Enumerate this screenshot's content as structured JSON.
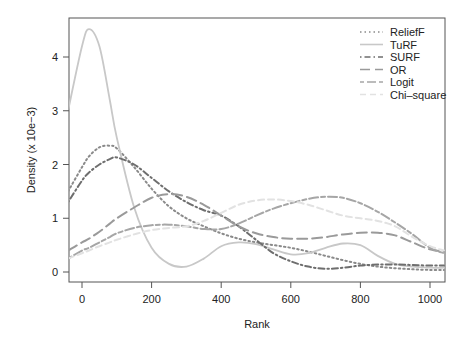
{
  "chart_data": {
    "type": "line",
    "title": "",
    "xlabel": "Rank",
    "ylabel": "Density (x 10e−3)",
    "xlim": [
      -40,
      1040
    ],
    "ylim": [
      -0.05,
      4.7
    ],
    "xticks": [
      "0",
      "200",
      "400",
      "600",
      "800",
      "1000"
    ],
    "xtick_values": [
      0,
      200,
      400,
      600,
      800,
      1000
    ],
    "yticks": [
      "0",
      "1",
      "2",
      "3",
      "4"
    ],
    "ytick_values": [
      0,
      1,
      2,
      3,
      4
    ],
    "grid": false,
    "legend_position": "top-right",
    "x": [
      -40,
      0,
      20,
      50,
      80,
      100,
      150,
      200,
      250,
      300,
      350,
      400,
      450,
      500,
      550,
      600,
      650,
      700,
      750,
      800,
      850,
      900,
      950,
      1000,
      1040
    ],
    "series": [
      {
        "name": "ReliefF",
        "style": "dotted",
        "color": "#8a8a8a",
        "values": [
          1.5,
          1.95,
          2.15,
          2.32,
          2.35,
          2.3,
          1.95,
          1.55,
          1.22,
          1.0,
          0.85,
          0.72,
          0.62,
          0.55,
          0.5,
          0.45,
          0.38,
          0.3,
          0.22,
          0.15,
          0.1,
          0.07,
          0.05,
          0.04,
          0.04
        ]
      },
      {
        "name": "TuRF",
        "style": "solid",
        "color": "#c8c8c8",
        "values": [
          3.0,
          4.2,
          4.52,
          4.2,
          3.2,
          2.5,
          1.2,
          0.45,
          0.15,
          0.1,
          0.25,
          0.48,
          0.55,
          0.52,
          0.42,
          0.33,
          0.35,
          0.45,
          0.53,
          0.5,
          0.3,
          0.15,
          0.1,
          0.08,
          0.08
        ]
      },
      {
        "name": "SURF",
        "style": "dotdash",
        "color": "#6e6e6e",
        "values": [
          1.3,
          1.7,
          1.85,
          2.0,
          2.1,
          2.13,
          2.0,
          1.75,
          1.5,
          1.3,
          1.15,
          1.05,
          0.85,
          0.6,
          0.35,
          0.2,
          0.1,
          0.06,
          0.08,
          0.12,
          0.14,
          0.14,
          0.13,
          0.12,
          0.12
        ]
      },
      {
        "name": "OR",
        "style": "longdash",
        "color": "#9a9a9a",
        "values": [
          0.4,
          0.55,
          0.62,
          0.75,
          0.9,
          1.0,
          1.2,
          1.38,
          1.45,
          1.4,
          1.25,
          1.05,
          0.85,
          0.72,
          0.65,
          0.62,
          0.62,
          0.65,
          0.7,
          0.73,
          0.73,
          0.68,
          0.55,
          0.42,
          0.38
        ]
      },
      {
        "name": "Logit",
        "style": "twodash",
        "color": "#a6a6a6",
        "values": [
          0.25,
          0.4,
          0.45,
          0.55,
          0.65,
          0.72,
          0.82,
          0.87,
          0.88,
          0.85,
          0.8,
          0.8,
          0.9,
          1.05,
          1.18,
          1.28,
          1.36,
          1.4,
          1.38,
          1.28,
          1.12,
          0.92,
          0.7,
          0.45,
          0.35
        ]
      },
      {
        "name": "Chi–square",
        "style": "dashed",
        "color": "#e2e2e2",
        "values": [
          0.25,
          0.35,
          0.4,
          0.48,
          0.55,
          0.6,
          0.7,
          0.78,
          0.82,
          0.85,
          0.95,
          1.1,
          1.25,
          1.33,
          1.35,
          1.32,
          1.25,
          1.15,
          1.05,
          1.0,
          0.95,
          0.85,
          0.65,
          0.48,
          0.4
        ]
      }
    ]
  },
  "legend": {
    "items": [
      {
        "label": "ReliefF"
      },
      {
        "label": "TuRF"
      },
      {
        "label": "SURF"
      },
      {
        "label": "OR"
      },
      {
        "label": "Logit"
      },
      {
        "label": "Chi–square"
      }
    ]
  }
}
